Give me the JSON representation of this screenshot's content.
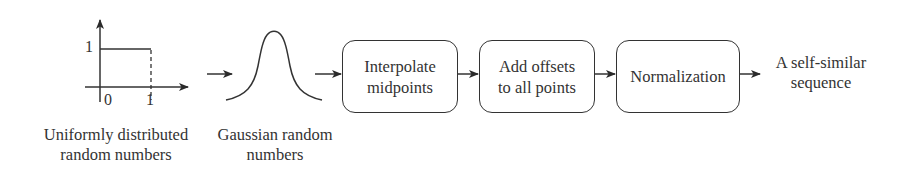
{
  "diagram": {
    "type": "flowchart",
    "direction": "left-to-right",
    "stroke_color": "#333333",
    "background": "#ffffff",
    "uniform_plot": {
      "y_tick": "1",
      "x_ticks": [
        "0",
        "1"
      ],
      "caption_line1": "Uniformly distributed",
      "caption_line2": "random numbers"
    },
    "gaussian_plot": {
      "caption_line1": "Gaussian random",
      "caption_line2": "numbers"
    },
    "steps": [
      {
        "line1": "Interpolate",
        "line2": "midpoints"
      },
      {
        "line1": "Add offsets",
        "line2": "to all points"
      },
      {
        "line1": "Normalization",
        "line2": ""
      }
    ],
    "output": {
      "line1": "A self-similar",
      "line2": "sequence"
    }
  }
}
